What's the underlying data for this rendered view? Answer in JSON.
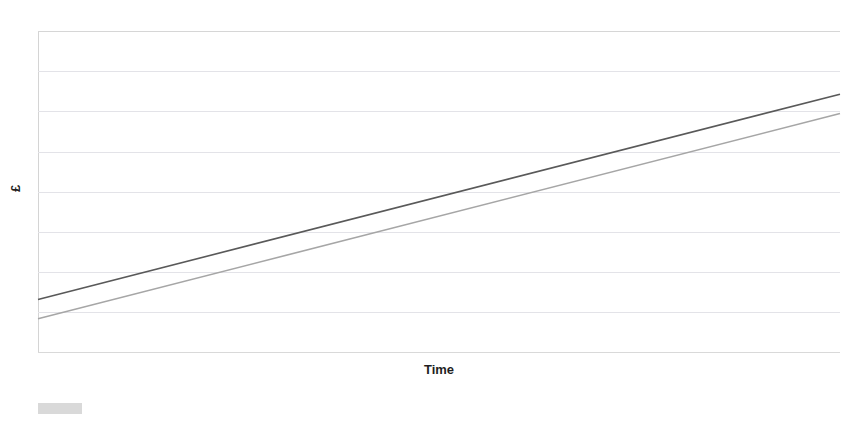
{
  "chart_data": {
    "type": "line",
    "title": "",
    "subtitle": "",
    "xlabel": "Time",
    "ylabel": "£",
    "xlim": [
      0,
      100
    ],
    "ylim": [
      0,
      8
    ],
    "grid": true,
    "grid_orientation": "horizontal",
    "gridline_count": 8,
    "legend_position": "below",
    "x": [
      0,
      100
    ],
    "series": [
      {
        "name": "Series 1",
        "color": "#595959",
        "values": [
          1.33,
          6.43
        ]
      },
      {
        "name": "Series 2",
        "color": "#a6a6a6",
        "values": [
          0.85,
          5.95
        ]
      }
    ],
    "annotations": []
  },
  "axes": {
    "y_title": "£",
    "x_title": "Time",
    "tick_labels_x": [],
    "tick_labels_y": []
  },
  "legend": {
    "entries": [
      {
        "label": "",
        "color": "#d9d9d9"
      },
      {
        "label": "",
        "color": "#ffffff"
      }
    ]
  },
  "colors": {
    "background": "#ffffff",
    "gridline": "#e3e3e8",
    "axis": "#d4d4d4",
    "series_primary": "#595959",
    "series_secondary": "#a6a6a6",
    "text": "#1f1f1f"
  }
}
